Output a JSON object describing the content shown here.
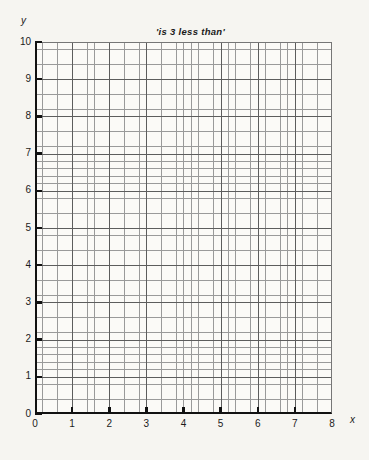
{
  "chart_data": {
    "type": "line",
    "title": "'is 3 less than'",
    "xlabel": "x",
    "ylabel": "y",
    "xlim": [
      0,
      8
    ],
    "ylim": [
      0,
      10
    ],
    "x_ticks": [
      "0",
      "1",
      "2",
      "3",
      "4",
      "5",
      "6",
      "7",
      "8"
    ],
    "y_ticks": [
      "0",
      "1",
      "2",
      "3",
      "4",
      "5",
      "6",
      "7",
      "8",
      "9",
      "10"
    ],
    "x_tick_values": [
      0,
      1,
      2,
      3,
      4,
      5,
      6,
      7,
      8
    ],
    "y_tick_values": [
      0,
      1,
      2,
      3,
      4,
      5,
      6,
      7,
      8,
      9,
      10
    ],
    "grid": true,
    "grid_minor_divisions": 5,
    "legend": null,
    "series": [],
    "values": [],
    "categories": [],
    "annotations": []
  },
  "chart": {
    "title": "'is 3 less than'",
    "y_axis_label": "y",
    "x_axis_label": "x",
    "y_ticks": [
      "10",
      "9",
      "8",
      "7",
      "6",
      "5",
      "4",
      "3",
      "2",
      "1",
      "0"
    ],
    "x_ticks": [
      "0",
      "1",
      "2",
      "3",
      "4",
      "5",
      "6",
      "7",
      "8"
    ]
  },
  "colors": {
    "page_background": "#f6f5f1",
    "plot_background": "#fbfaf7",
    "grid_minor": "#9a9a9a",
    "grid_major": "#5d5d5d",
    "axis": "#111111",
    "text": "#1b1b1b"
  }
}
